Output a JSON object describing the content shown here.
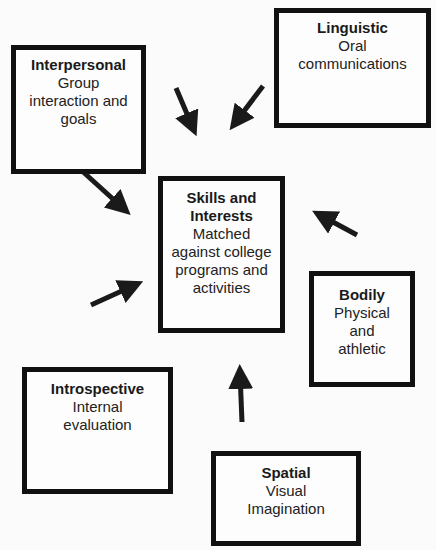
{
  "diagram": {
    "center": {
      "title": "Skills and Interests",
      "description": "Matched against college programs and activities"
    },
    "nodes": [
      {
        "id": "interpersonal",
        "title": "Interpersonal",
        "description": "Group interaction and goals"
      },
      {
        "id": "linguistic",
        "title": "Linguistic",
        "description": "Oral communications"
      },
      {
        "id": "bodily",
        "title": "Bodily",
        "description": "Physical and athletic"
      },
      {
        "id": "introspective",
        "title": "Introspective",
        "description": "Internal evaluation"
      },
      {
        "id": "spatial",
        "title": "Spatial",
        "description": "Visual Imagination"
      }
    ],
    "edges": [
      {
        "from": "interpersonal",
        "to": "center"
      },
      {
        "from": "interpersonal",
        "to": "center"
      },
      {
        "from": "linguistic",
        "to": "center"
      },
      {
        "from": "introspective",
        "to": "center"
      },
      {
        "from": "bodily",
        "to": "center"
      },
      {
        "from": "spatial",
        "to": "center"
      }
    ],
    "colors": {
      "border": "#111111",
      "background": "#fbfbfb",
      "arrow": "#1a1a1a"
    }
  }
}
